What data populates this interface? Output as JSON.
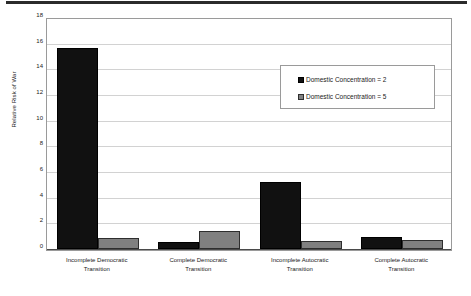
{
  "figure": {
    "top_rule": "horizontal-rule",
    "background_color": "#ffffff"
  },
  "legend": {
    "position": "inside-top-right",
    "entries": [
      {
        "label": "Domestic Concentration = 2",
        "swatch_name": "legend-swatch-black",
        "color": "#111111"
      },
      {
        "label": "Domestic Concentration = 5",
        "swatch_name": "legend-swatch-gray",
        "color": "#808080"
      }
    ]
  },
  "chart_data": {
    "type": "bar",
    "title": "",
    "subtitle": "",
    "xlabel": "",
    "ylabel": "Relative Risk of War",
    "ylim": [
      0,
      18
    ],
    "ytick_labels": [
      "0",
      "2",
      "4",
      "6",
      "8",
      "10",
      "12",
      "14",
      "16",
      "18"
    ],
    "yticks": [
      0,
      2,
      4,
      6,
      8,
      10,
      12,
      14,
      16,
      18
    ],
    "grid": true,
    "grid_axis": "y",
    "legend_position": "upper right",
    "categories": [
      "Incomplete Democratic Transition",
      "Complete Democratic Transition",
      "Incomplete Autocratic Transition",
      "Complete Autocratic Transition"
    ],
    "category_lines": [
      [
        "Incomplete Democratic",
        "Transition"
      ],
      [
        "Complete Democratic",
        "Transition"
      ],
      [
        "Incomplete Autocratic",
        "Transition"
      ],
      [
        "Complete Autocratic",
        "Transition"
      ]
    ],
    "series": [
      {
        "name": "Domestic Concentration = 2",
        "color": "#111111",
        "values": [
          15.7,
          0.55,
          5.2,
          0.95
        ]
      },
      {
        "name": "Domestic Concentration = 5",
        "color": "#808080",
        "values": [
          0.85,
          1.4,
          0.62,
          0.68
        ]
      }
    ]
  }
}
